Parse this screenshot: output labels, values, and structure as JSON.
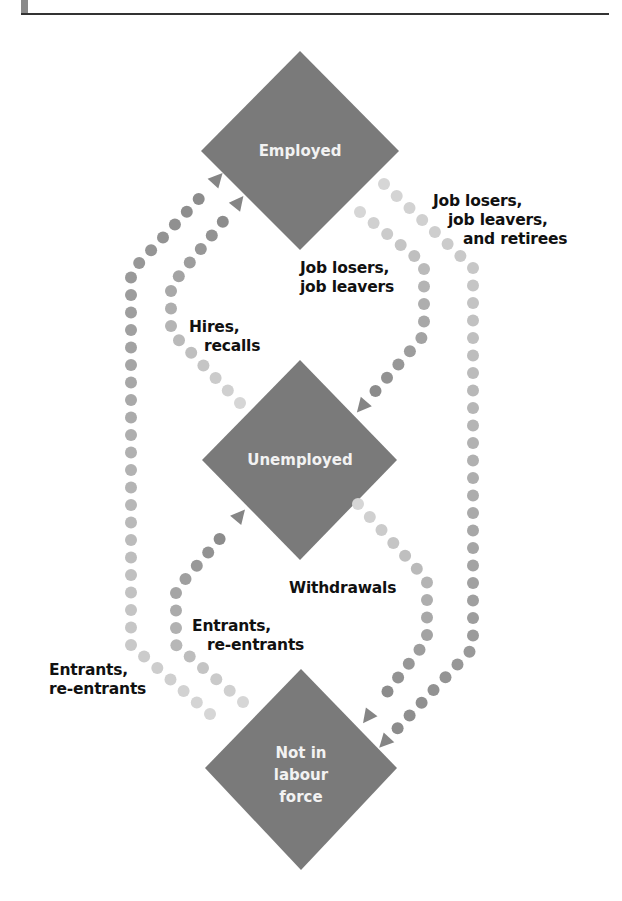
{
  "colors": {
    "node_fill": "#7a7a7a",
    "node_text": "#f2f2f2",
    "label_text": "#111111",
    "dot_dark": "#8c8c8c",
    "dot_light": "#d6d6d6",
    "header_rule": "#333333"
  },
  "nodes": {
    "employed": {
      "label": "Employed"
    },
    "unemployed": {
      "label": "Unemployed"
    },
    "not_in_labour_force": {
      "line1": "Not in",
      "line2": "labour",
      "line3": "force"
    }
  },
  "flows": {
    "employed_to_nilf": {
      "line1": "Job losers,",
      "line2": "job leavers,",
      "line3": "and retirees"
    },
    "employed_to_unemployed": {
      "line1": "Job losers,",
      "line2": "job leavers"
    },
    "unemployed_to_employed": {
      "line1": "Hires,",
      "line2": "recalls"
    },
    "unemployed_to_nilf": {
      "line1": "Withdrawals"
    },
    "nilf_to_unemployed": {
      "line1": "Entrants,",
      "line2": "re-entrants"
    },
    "nilf_to_employed": {
      "line1": "Entrants,",
      "line2": "re-entrants"
    }
  }
}
